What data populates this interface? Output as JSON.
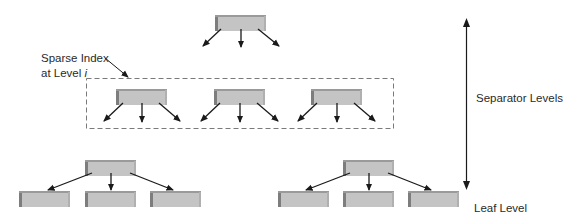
{
  "diagram": {
    "colors": {
      "node_fill": "#c4c4c4",
      "node_shadow": "#7d7d7d",
      "node_top_edge": "#9a9a9a",
      "arrow": "#1a1a1a",
      "dashed_box": "#7a7a7a",
      "text": "#2a2a2a"
    },
    "annotations": {
      "sparse_index_line1": "Sparse Index",
      "sparse_index_line2_prefix": "at Level ",
      "sparse_index_line2_var": "i",
      "separator_levels": "Separator Levels",
      "leaf_level": "Leaf Level"
    },
    "levels": [
      {
        "name": "root",
        "nodes": 1,
        "fanout_arrows": 3
      },
      {
        "name": "sparse-index-level-i",
        "nodes": 3,
        "fanout_arrows": 3,
        "enclosed_in_dashed_box": true
      },
      {
        "name": "lower-separator",
        "nodes": 2,
        "fanout_arrows": 3
      },
      {
        "name": "leaf",
        "nodes": 6,
        "fanout_arrows": 0
      }
    ]
  }
}
